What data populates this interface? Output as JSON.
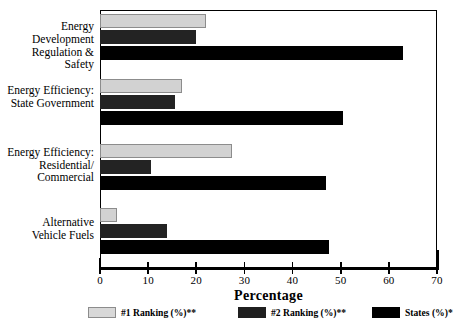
{
  "chart_data": {
    "type": "bar",
    "orientation": "horizontal",
    "title": "",
    "xlabel": "Percentage",
    "ylabel": "",
    "xlim": [
      0,
      70
    ],
    "xticks": [
      0,
      10,
      20,
      30,
      40,
      50,
      60,
      70
    ],
    "xtick_labels": [
      "0",
      "10",
      "20",
      "30",
      "40",
      "50",
      "60",
      "70"
    ],
    "grid": false,
    "legend_position": "bottom",
    "categories": [
      "Energy Development\nRegulation & Safety",
      "Energy Efficiency:\nState Government",
      "Energy Efficiency:\nResidential/\nCommercial",
      "Alternative\nVehicle Fuels"
    ],
    "category_lines": [
      [
        "Energy Development",
        "Regulation & Safety"
      ],
      [
        "Energy Efficiency:",
        "State Government"
      ],
      [
        "Energy Efficiency:",
        "Residential/",
        "Commercial"
      ],
      [
        "Alternative",
        "Vehicle Fuels"
      ]
    ],
    "series": [
      {
        "name": "#1 Ranking (%)**",
        "color": "#d2d2d2",
        "values": [
          22,
          17,
          27.5,
          3.5
        ]
      },
      {
        "name": "#2 Ranking (%)**",
        "color": "#232323",
        "values": [
          20,
          15.5,
          10.5,
          14
        ]
      },
      {
        "name": "States (%)*",
        "color": "#000000",
        "values": [
          63,
          50.5,
          47,
          47.5
        ]
      }
    ]
  },
  "axis_title": "Percentage",
  "legend": [
    {
      "label": "#1 Ranking (%)**"
    },
    {
      "label": "#2 Ranking (%)**"
    },
    {
      "label": "States (%)*"
    }
  ],
  "footnote": ""
}
